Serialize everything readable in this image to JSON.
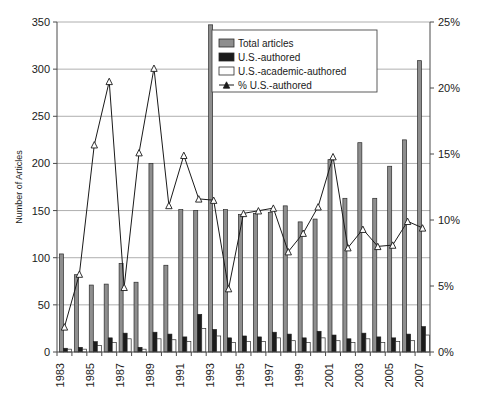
{
  "chart_data": {
    "type": "bar",
    "title": "",
    "xlabel": "",
    "ylabel": "Number of Articles",
    "y2label": "",
    "ylim": [
      0,
      350
    ],
    "y2lim": [
      0,
      25
    ],
    "grid": true,
    "legend_position": "top-right",
    "categories": [
      1983,
      1984,
      1985,
      1986,
      1987,
      1988,
      1989,
      1990,
      1991,
      1992,
      1993,
      1994,
      1995,
      1996,
      1997,
      1998,
      1999,
      2000,
      2001,
      2002,
      2003,
      2004,
      2005,
      2006,
      2007
    ],
    "x_tick_labels": [
      "1983",
      "1985",
      "1987",
      "1989",
      "1991",
      "1993",
      "1995",
      "1997",
      "1999",
      "2001",
      "2003",
      "2005",
      "2007"
    ],
    "y_tick_labels": [
      "0",
      "50",
      "100",
      "150",
      "200",
      "250",
      "300",
      "350"
    ],
    "y2_tick_labels": [
      "0%",
      "5%",
      "10%",
      "15%",
      "20%",
      "25%"
    ],
    "series": [
      {
        "name": "Total articles",
        "axis": "left",
        "type": "bar",
        "color": "#8e8e8e",
        "values": [
          104,
          82,
          71,
          72,
          94,
          74,
          200,
          92,
          151,
          150,
          347,
          151,
          146,
          147,
          148,
          155,
          138,
          141,
          204,
          163,
          222,
          163,
          197,
          225,
          309
        ]
      },
      {
        "name": "U.S.-authored",
        "axis": "left",
        "type": "bar",
        "color": "#1b1b1b",
        "values": [
          4,
          5,
          11,
          15,
          20,
          5,
          21,
          19,
          16,
          40,
          24,
          15,
          17,
          16,
          21,
          19,
          15,
          22,
          18,
          14,
          20,
          16,
          15,
          19,
          27
        ]
      },
      {
        "name": "U.S.-academic-authored",
        "axis": "left",
        "type": "bar",
        "color": "#fdfdfd",
        "values": [
          3,
          3,
          7,
          10,
          14,
          3,
          14,
          13,
          11,
          25,
          17,
          10,
          11,
          11,
          15,
          12,
          10,
          15,
          12,
          10,
          14,
          10,
          11,
          12,
          18
        ]
      },
      {
        "name": "% U.S.-authored",
        "axis": "right",
        "type": "line",
        "marker": "triangle",
        "color": "#1a1a1a",
        "values": [
          1.9,
          5.9,
          15.7,
          20.5,
          4.9,
          15.1,
          21.5,
          11.1,
          14.9,
          11.6,
          11.5,
          4.8,
          10.5,
          10.7,
          10.9,
          7.6,
          9.0,
          11.0,
          14.8,
          7.9,
          9.3,
          8.0,
          8.1,
          9.9,
          9.4
        ]
      }
    ]
  },
  "legend": {
    "items": [
      {
        "label": "Total articles",
        "marker": "swatch-gray"
      },
      {
        "label": "U.S.-authored",
        "marker": "swatch-black"
      },
      {
        "label": "U.S.-academic-authored",
        "marker": "swatch-white"
      },
      {
        "label": "% U.S.-authored",
        "marker": "line-triangle"
      }
    ]
  }
}
